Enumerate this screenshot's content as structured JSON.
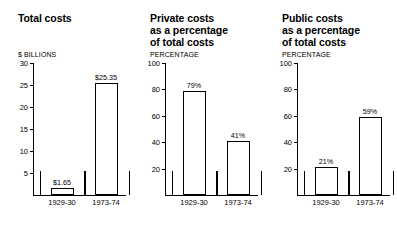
{
  "figure": {
    "background": "#ffffff",
    "ink_color": "#000000"
  },
  "chart_data": [
    {
      "type": "bar",
      "title": "Total costs",
      "ylabel": "$ BILLIONS",
      "xlabel": "",
      "categories": [
        "1929-30",
        "1973-74"
      ],
      "values": [
        1.65,
        25.35
      ],
      "data_labels": [
        "$1.65",
        "$25.35"
      ],
      "ylim": [
        0,
        30
      ],
      "yticks": [
        30,
        25,
        20,
        15,
        10,
        5
      ],
      "ytick_labels": [
        "30",
        "25",
        "20",
        "15",
        "10",
        "5"
      ],
      "grid": false,
      "legend": false
    },
    {
      "type": "bar",
      "title": "Private costs\nas a percentage\nof total costs",
      "ylabel": "PERCENTAGE",
      "xlabel": "",
      "categories": [
        "1929-30",
        "1973-74"
      ],
      "values": [
        79,
        41
      ],
      "data_labels": [
        "79%",
        "41%"
      ],
      "ylim": [
        0,
        100
      ],
      "yticks": [
        100,
        80,
        60,
        40,
        20
      ],
      "ytick_labels": [
        "100",
        "80",
        "60",
        "40",
        "20"
      ],
      "grid": false,
      "legend": false
    },
    {
      "type": "bar",
      "title": "Public costs\nas a percentage\nof total costs",
      "ylabel": "PERCENTAGE",
      "xlabel": "",
      "categories": [
        "1929-30",
        "1973-74"
      ],
      "values": [
        21,
        59
      ],
      "data_labels": [
        "21%",
        "59%"
      ],
      "ylim": [
        0,
        100
      ],
      "yticks": [
        100,
        80,
        60,
        40,
        20
      ],
      "ytick_labels": [
        "100",
        "80",
        "60",
        "40",
        "20"
      ],
      "grid": false,
      "legend": false
    }
  ]
}
